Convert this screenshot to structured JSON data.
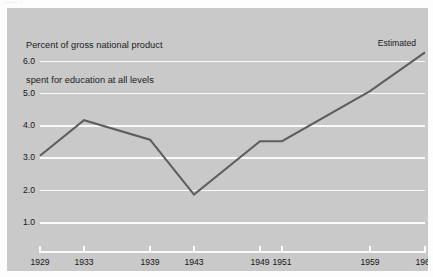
{
  "figure": {
    "background_color": "#fdfdfd",
    "panel_color": "#c9c9c9",
    "gridline_color": "#fbfbfb",
    "line_color": "#5e5e5e",
    "text_color": "#161616",
    "caption_remnant": "CHART 1."
  },
  "title": {
    "line1": "Percent of gross national product",
    "line2": "spent for education at all levels"
  },
  "annotations": [
    {
      "name": "estimated",
      "text": "Estimated",
      "at_x": "1964"
    }
  ],
  "chart_data": {
    "type": "line",
    "title": "Percent of gross national product spent for education at all levels",
    "subtitle": "",
    "xlabel": "",
    "ylabel": "",
    "x": [
      "1929",
      "1933",
      "1939",
      "1943",
      "1949",
      "1951",
      "1959",
      "1964"
    ],
    "x_positions": [
      1929,
      1933,
      1939,
      1943,
      1949,
      1951,
      1959,
      1964
    ],
    "values": [
      3.05,
      4.15,
      3.55,
      1.85,
      3.5,
      3.5,
      5.05,
      6.25
    ],
    "series": [
      {
        "name": "Percent of GNP spent for education",
        "values": [
          3.05,
          4.15,
          3.55,
          1.85,
          3.5,
          3.5,
          5.05,
          6.25
        ],
        "color": "#5e5e5e"
      }
    ],
    "xtick_labels": [
      "1929",
      "1933",
      "1939",
      "1943",
      "1949",
      "1951",
      "1959",
      "1964"
    ],
    "ytick_labels": [
      "6.0",
      "5.0",
      "4.0",
      "3.0",
      "2.0",
      "1.0"
    ],
    "yticks": [
      6.0,
      5.0,
      4.0,
      3.0,
      2.0,
      1.0
    ],
    "ylim": [
      0.35,
      6.45
    ],
    "xlim": [
      1929,
      1964
    ],
    "grid": "horizontal",
    "legend": "none",
    "annotations": [
      "Estimated"
    ]
  }
}
